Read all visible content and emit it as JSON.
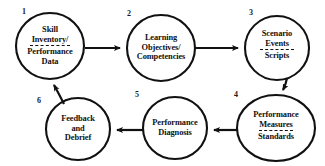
{
  "diagram": {
    "type": "cycle-flowchart",
    "stroke_color": "#111111",
    "background": "#ffffff",
    "nodes": [
      {
        "number": "1",
        "name": "skill-inventory",
        "lines_top": [
          "Skill",
          "Inventory/"
        ],
        "divider": true,
        "lines_bottom": [
          "Performance",
          "Data"
        ]
      },
      {
        "number": "2",
        "name": "learning-objectives",
        "lines_top": [
          "Learning",
          "Objectives/",
          "Competencies"
        ],
        "divider": false,
        "lines_bottom": []
      },
      {
        "number": "3",
        "name": "scenario-events",
        "lines_top": [
          "Scenario",
          "Events"
        ],
        "divider": true,
        "lines_bottom": [
          "Scripts"
        ]
      },
      {
        "number": "4",
        "name": "performance-measures",
        "lines_top": [
          "Performance",
          "Measures"
        ],
        "divider": true,
        "lines_bottom": [
          "Standards"
        ]
      },
      {
        "number": "5",
        "name": "performance-diagnosis",
        "lines_top": [
          "Performance",
          "Diagnosis"
        ],
        "divider": false,
        "lines_bottom": []
      },
      {
        "number": "6",
        "name": "feedback-and-debrief",
        "lines_top": [
          "Feedback",
          "and",
          "Debrief"
        ],
        "divider": false,
        "lines_bottom": []
      }
    ],
    "edges": [
      {
        "from": "1",
        "to": "2",
        "direction": "right"
      },
      {
        "from": "2",
        "to": "3",
        "direction": "right"
      },
      {
        "from": "3",
        "to": "4",
        "direction": "down"
      },
      {
        "from": "4",
        "to": "5",
        "direction": "left"
      },
      {
        "from": "5",
        "to": "6",
        "direction": "left"
      },
      {
        "from": "6",
        "to": "1",
        "direction": "up-left"
      }
    ]
  },
  "node1": {
    "number": "1",
    "l1": "Skill",
    "l2": "Inventory/",
    "l3": "Performance",
    "l4": "Data"
  },
  "node2": {
    "number": "2",
    "l1": "Learning",
    "l2": "Objectives/",
    "l3": "Competencies"
  },
  "node3": {
    "number": "3",
    "l1": "Scenario",
    "l2": "Events",
    "l3": "Scripts"
  },
  "node4": {
    "number": "4",
    "l1": "Performance",
    "l2": "Measures",
    "l3": "Standards"
  },
  "node5": {
    "number": "5",
    "l1": "Performance",
    "l2": "Diagnosis"
  },
  "node6": {
    "number": "6",
    "l1": "Feedback",
    "l2": "and",
    "l3": "Debrief"
  }
}
